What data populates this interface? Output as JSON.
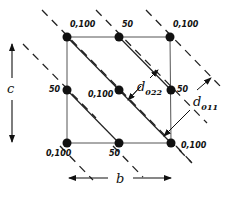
{
  "diagram": {
    "axes": {
      "b_label": "b",
      "c_label": "c"
    },
    "points": [
      {
        "id": "p00",
        "label": "0,100",
        "x": 67,
        "y": 37
      },
      {
        "id": "p10",
        "label": "50",
        "x": 119,
        "y": 37
      },
      {
        "id": "p20",
        "label": "0,100",
        "x": 170,
        "y": 37
      },
      {
        "id": "p01",
        "label": "50",
        "x": 67,
        "y": 90
      },
      {
        "id": "p11",
        "label": "0,100",
        "x": 119,
        "y": 90
      },
      {
        "id": "p21",
        "label": "50",
        "x": 171,
        "y": 90
      },
      {
        "id": "p02",
        "label": "0,100",
        "x": 67,
        "y": 143
      },
      {
        "id": "p12",
        "label": "50",
        "x": 119,
        "y": 143
      },
      {
        "id": "p22",
        "label": "0,100",
        "x": 171,
        "y": 143
      }
    ],
    "spacings": [
      {
        "id": "d022",
        "symbol": "d",
        "subscript": "022"
      },
      {
        "id": "d011",
        "symbol": "d",
        "subscript": "011"
      }
    ],
    "colors": {
      "ink": "#111111",
      "grid": "#555555",
      "background": "#ffffff"
    }
  }
}
